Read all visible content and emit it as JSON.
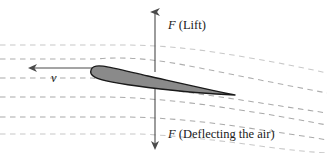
{
  "figure": {
    "background_color": "#ffffff",
    "width": 327,
    "height": 153,
    "labels": {
      "lift_symbol": "F",
      "lift_text": " (Lift)",
      "lift_full": "F (Lift)",
      "deflect_symbol": "F",
      "deflect_text": " (Deflecting the air)",
      "deflect_full": "F (Deflecting the air)",
      "velocity_symbol": "v"
    },
    "colors": {
      "streamline": "#9a9a9a",
      "airfoil_fill": "#8a8a8a",
      "airfoil_outline": "#1a1a1a",
      "arrow": "#4a4a4a",
      "text": "#1a1a1a"
    },
    "arrows": {
      "vertical_axis_x": 155,
      "lift_arrow_top_y": 8,
      "deflect_arrow_bottom_y": 148,
      "velocity_arrow_y": 68,
      "velocity_arrow_from_x": 93,
      "velocity_arrow_to_x": 30
    },
    "airfoil": {
      "leading_edge_x": 93,
      "leading_edge_y": 72,
      "trailing_edge_x": 235,
      "trailing_edge_y": 95,
      "chord_px": 142
    },
    "streamlines": {
      "count": 6,
      "style": "dashed",
      "left_y_values": [
        45,
        60,
        78,
        97,
        117
      ],
      "description": "Horizontal dashed streamlines entering from the left, deflected downward past the airfoil"
    }
  }
}
